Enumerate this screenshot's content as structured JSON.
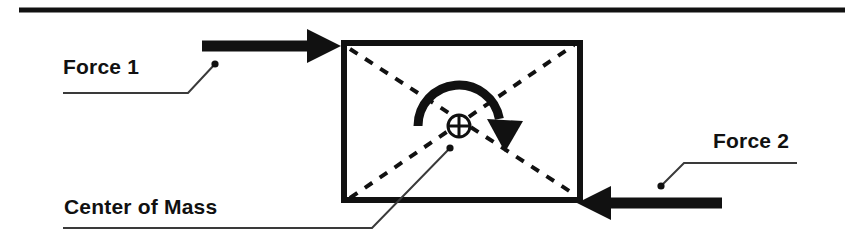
{
  "figure": {
    "background_color": "#ffffff",
    "ink_color": "#111111",
    "leader_color": "#3a3a3a"
  },
  "labels": {
    "force_1": "Force 1",
    "force_2": "Force 2",
    "center_of_mass": "Center of Mass"
  },
  "icons": {
    "center_of_mass": "center-of-mass-icon",
    "rotation": "rotation-arrow-icon",
    "force_1_arrow": "arrow-right-icon",
    "force_2_arrow": "arrow-left-icon"
  },
  "chart_data": {
    "type": "diagram",
    "grid": false,
    "legend": "none",
    "xlim": [
      0,
      862
    ],
    "ylim": [
      0,
      252
    ],
    "top_rule": {
      "name": "top-divider",
      "x1": 19,
      "x2": 845,
      "y": 10,
      "thickness": 5,
      "color": "#111111"
    },
    "body": {
      "name": "rigid-body-box",
      "x": 341,
      "y": 40,
      "width": 242,
      "height": 163,
      "stroke": "#111111",
      "stroke_width": 6,
      "fill": "none"
    },
    "diagonals": [
      {
        "name": "diagonal-top-left-to-bottom-right",
        "x1": 348,
        "y1": 47,
        "x2": 576,
        "y2": 196,
        "style": "dashed",
        "dash": "9 9",
        "stroke_width": 4,
        "color": "#111111"
      },
      {
        "name": "diagonal-bottom-left-to-top-right",
        "x1": 348,
        "y1": 196,
        "x2": 576,
        "y2": 47,
        "style": "dashed",
        "dash": "9 9",
        "stroke_width": 4,
        "color": "#111111"
      }
    ],
    "center_of_mass": {
      "name": "center-of-mass-symbol",
      "cx": 459,
      "cy": 126,
      "radius": 11,
      "stroke_width": 3,
      "color": "#111111",
      "description": "circle with vertical and horizontal cross hairs"
    },
    "rotation_arrow": {
      "name": "rotation-arrow",
      "sense": "clockwise",
      "arc_center_x": 459,
      "arc_center_y": 126,
      "arc_radius": 41,
      "start_angle_deg": 180,
      "end_angle_deg": 10,
      "stroke_width": 9,
      "head_x": 505,
      "head_y": 141,
      "color": "#111111"
    },
    "forces": [
      {
        "name": "force-1",
        "label": "Force 1",
        "direction": "right",
        "tail_x": 202,
        "tip_x": 341,
        "y": 46,
        "shaft_thickness": 11,
        "head_length": 34,
        "head_half_height": 17,
        "color": "#111111",
        "leader": {
          "dot_x": 215,
          "dot_y": 64,
          "elbow_x": 188,
          "elbow_y": 93,
          "end_x": 63,
          "end_y": 93
        }
      },
      {
        "name": "force-2",
        "label": "Force 2",
        "direction": "left",
        "tail_x": 722,
        "tip_x": 577,
        "y": 203,
        "shaft_thickness": 11,
        "head_length": 34,
        "head_half_height": 17,
        "color": "#111111",
        "leader": {
          "dot_x": 661,
          "dot_y": 186,
          "elbow_x": 684,
          "elbow_y": 163,
          "end_x": 797,
          "end_y": 163
        }
      }
    ],
    "annotations": [
      {
        "name": "center-of-mass-leader",
        "label": "Center of Mass",
        "dot_x": 450,
        "dot_y": 148,
        "elbow_x": 372,
        "elbow_y": 228,
        "end_x": 63,
        "end_y": 228
      }
    ]
  }
}
